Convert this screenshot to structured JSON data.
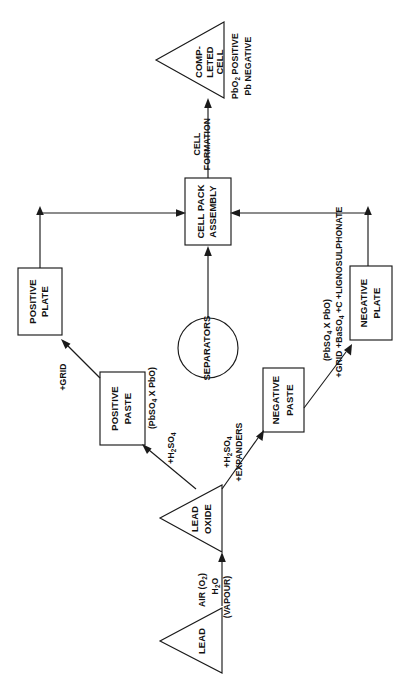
{
  "diagram": {
    "orientation": "rotated-90-ccw",
    "colors": {
      "stroke": "#1a1a1a",
      "text": "#111111",
      "background": "#ffffff"
    },
    "nodes": [
      {
        "id": "lead",
        "shape": "triangle",
        "lines": [
          "LEAD"
        ]
      },
      {
        "id": "lead-oxide",
        "shape": "triangle",
        "lines": [
          "LEAD",
          "OXIDE"
        ]
      },
      {
        "id": "positive-paste",
        "shape": "box",
        "lines": [
          "POSITIVE",
          "PASTE"
        ]
      },
      {
        "id": "negative-paste",
        "shape": "box",
        "lines": [
          "NEGATIVE",
          "PASTE"
        ]
      },
      {
        "id": "positive-plate",
        "shape": "box",
        "lines": [
          "POSITIVE",
          "PLATE"
        ]
      },
      {
        "id": "negative-plate",
        "shape": "box",
        "lines": [
          "NEGATIVE",
          "PLATE"
        ]
      },
      {
        "id": "separators",
        "shape": "circle",
        "lines": [
          "SEPARATORS"
        ]
      },
      {
        "id": "cell-pack-assembly",
        "shape": "box",
        "lines": [
          "CELL PACK",
          "ASSEMBLY"
        ]
      },
      {
        "id": "completed-cell",
        "shape": "triangle",
        "lines": [
          "COMP-",
          "LETED",
          "CELL"
        ]
      }
    ],
    "node_text": {
      "lead": "LEAD",
      "lead_oxide_line1": "LEAD",
      "lead_oxide_line2": "OXIDE",
      "positive_paste_line1": "POSITIVE",
      "positive_paste_line2": "PASTE",
      "negative_paste_line1": "NEGATIVE",
      "negative_paste_line2": "PASTE",
      "positive_plate_line1": "POSITIVE",
      "positive_plate_line2": "PLATE",
      "negative_plate_line1": "NEGATIVE",
      "negative_plate_line2": "PLATE",
      "separators": "SEPARATORS",
      "cell_pack_line1": "CELL PACK",
      "cell_pack_line2": "ASSEMBLY",
      "completed_cell_line1": "COMP-",
      "completed_cell_line2": "LETED",
      "completed_cell_line3": "CELL"
    },
    "edge_labels": {
      "air_o2": "AIR (O",
      "air_o2_sub": "2",
      "air_o2_close": ")",
      "h2o": "H",
      "h2o_sub": "2",
      "h2o_rest": "O",
      "vapour": "(VAPOUR)",
      "pos_acid_pre": "+H",
      "pos_acid_sub": "2",
      "pos_acid_post": "SO",
      "pos_acid_sub2": "4",
      "neg_acid_pre": "+H",
      "neg_acid_sub": "2",
      "neg_acid_post": "SO",
      "neg_acid_sub2": "4",
      "expanders": "+EXPANDERS",
      "pos_paste_formula_pre": "(PbSO",
      "pos_paste_formula_sub": "4",
      "pos_paste_formula_post": " X PbO)",
      "neg_paste_formula_pre": "(PbSO",
      "neg_paste_formula_sub": "4",
      "neg_paste_formula_post": " X PbO)",
      "pos_grid": "+GRID",
      "neg_grid_pre": "+GRID +BaSO",
      "neg_grid_sub": "4",
      "neg_grid_post": " +C +LIGNOSULPHONATE",
      "cell_formation_line1": "CELL",
      "cell_formation_line2": "FORMATION"
    },
    "side_labels": {
      "pbo2_positive_pre": "PbO",
      "pbo2_positive_sub": "2",
      "pbo2_positive_post": "  POSITIVE",
      "pb_negative": "Pb NEGATIVE"
    },
    "edges": [
      {
        "from": "lead",
        "to": "lead-oxide",
        "labels": [
          "AIR (O2)",
          "H2O (VAPOUR)"
        ]
      },
      {
        "from": "lead-oxide",
        "to": "positive-paste",
        "labels": [
          "+H2SO4"
        ]
      },
      {
        "from": "lead-oxide",
        "to": "negative-paste",
        "labels": [
          "+H2SO4",
          "+EXPANDERS"
        ]
      },
      {
        "from": "positive-paste",
        "to": "positive-plate",
        "labels": [
          "+GRID",
          "(PbSO4 X PbO)"
        ]
      },
      {
        "from": "negative-paste",
        "to": "negative-plate",
        "labels": [
          "+GRID +BaSO4 +C +LIGNOSULPHONATE",
          "(PbSO4 X PbO)"
        ]
      },
      {
        "from": "positive-plate",
        "to": "cell-pack-assembly",
        "labels": []
      },
      {
        "from": "negative-plate",
        "to": "cell-pack-assembly",
        "labels": []
      },
      {
        "from": "separators",
        "to": "cell-pack-assembly",
        "labels": []
      },
      {
        "from": "cell-pack-assembly",
        "to": "completed-cell",
        "labels": [
          "CELL FORMATION"
        ]
      }
    ]
  }
}
